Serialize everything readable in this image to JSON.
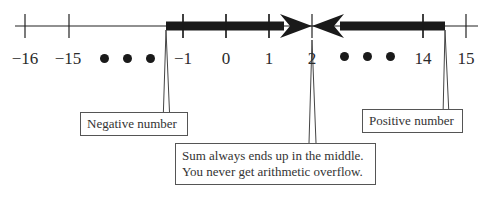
{
  "number_line": {
    "tick_labels": [
      {
        "value": "−16",
        "x": 25
      },
      {
        "value": "−15",
        "x": 68
      },
      {
        "value": "−1",
        "x": 183
      },
      {
        "value": "0",
        "x": 226
      },
      {
        "value": "1",
        "x": 269
      },
      {
        "value": "2",
        "x": 312
      },
      {
        "value": "14",
        "x": 423
      },
      {
        "value": "15",
        "x": 466
      }
    ],
    "ellipsis_left": "• • •",
    "ellipsis_right": "• • •",
    "colors": {
      "line": "#222222",
      "thick_bar": "#1a1a1a",
      "box_border": "#555555"
    }
  },
  "callouts": {
    "negative": "Negative number",
    "positive": "Positive number",
    "middle_line1": "Sum always ends up in the middle.",
    "middle_line2": "You never get arithmetic overflow."
  }
}
